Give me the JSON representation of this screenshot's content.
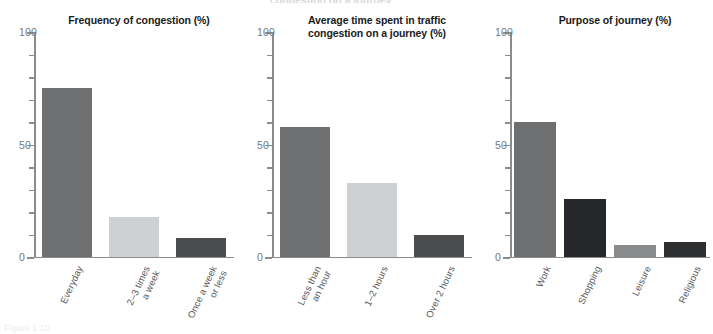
{
  "figure": {
    "width": 713,
    "height": 327,
    "background": "#ffffff",
    "axis_color": "#8c8c8c",
    "tick_label_color": "#77787b",
    "category_label_color": "#58595b",
    "title_color": "#1a1a1a"
  },
  "palette": {
    "medium_gray": "#6e6f71",
    "light_gray": "#cfd0d1",
    "dark_gray": "#4b4c4e",
    "near_black": "#26272a",
    "mid_gray_alt": "#8a8b8d"
  },
  "axis": {
    "y_labels": [
      "100",
      "50",
      "0"
    ],
    "y_label_values": [
      100,
      50,
      0
    ],
    "y_minor_values": [
      90,
      80,
      70,
      60,
      40,
      30,
      20,
      10
    ],
    "ylim": [
      0,
      100
    ]
  },
  "chart_data": [
    {
      "type": "bar",
      "title": "Frequency of congestion (%)",
      "xlabel": "",
      "ylabel": "",
      "ylim": [
        0,
        100
      ],
      "grid": false,
      "legend": "none",
      "categories": [
        "Everyday",
        "2–3 times\na week",
        "Once a week\nor less"
      ],
      "category_lines": [
        [
          "Everyday"
        ],
        [
          "2–3 times",
          "a week"
        ],
        [
          "Once a week",
          "or less"
        ]
      ],
      "values": [
        75,
        18,
        8.5
      ],
      "colors": [
        "#6e6f71",
        "#cfd0d1",
        "#4b4c4e"
      ]
    },
    {
      "type": "bar",
      "title": "Average time spent in traffic congestion on a journey (%)",
      "xlabel": "",
      "ylabel": "",
      "ylim": [
        0,
        100
      ],
      "grid": false,
      "legend": "none",
      "categories": [
        "Less than\nan hour",
        "1–2 hours",
        "Over 2 hours"
      ],
      "category_lines": [
        [
          "Less than",
          "an hour"
        ],
        [
          "1–2 hours"
        ],
        [
          "Over 2 hours"
        ]
      ],
      "values": [
        58,
        33,
        10
      ],
      "colors": [
        "#6e6f71",
        "#cfd0d1",
        "#4b4c4e"
      ]
    },
    {
      "type": "bar",
      "title": "Purpose of journey (%)",
      "xlabel": "",
      "ylabel": "",
      "ylim": [
        0,
        100
      ],
      "grid": false,
      "legend": "none",
      "categories": [
        "Work",
        "Shopping",
        "Leisure",
        "Religious"
      ],
      "category_lines": [
        [
          "Work"
        ],
        [
          "Shopping"
        ],
        [
          "Leisure"
        ],
        [
          "Religious"
        ]
      ],
      "values": [
        60,
        26,
        5.5,
        6.5
      ],
      "colors": [
        "#6e6f71",
        "#26272a",
        "#8a8b8d",
        "#2e2f31"
      ]
    }
  ],
  "panels": [
    {
      "title_line1": "Frequency of congestion (%)",
      "title_line2": ""
    },
    {
      "title_line1": "Average time spent in traffic",
      "title_line2": "congestion on a journey (%)"
    },
    {
      "title_line1": "Purpose of journey (%)",
      "title_line2": ""
    }
  ],
  "artifacts": {
    "top_cropped_text": "congestion on a journey",
    "bottom_cropped_text": "Figure 1.10"
  }
}
